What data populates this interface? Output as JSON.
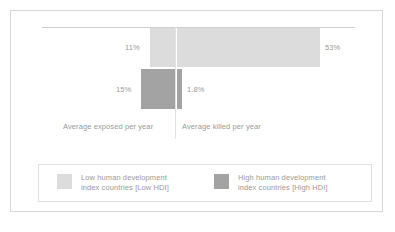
{
  "chart_data": {
    "type": "bar",
    "title": "",
    "subtitle": "",
    "orientation": "horizontal-diverging",
    "xlabel": "",
    "ylabel": "",
    "grid": false,
    "legend_position": "bottom",
    "categories": [
      "Average exposed per year",
      "Average killed per year"
    ],
    "series": [
      {
        "name": "Low human development index countries (Low HDI)",
        "color": "#dcdcdc",
        "values": [
          11,
          53
        ],
        "value_labels": [
          "11%",
          "53%"
        ]
      },
      {
        "name": "High human development index countries (High HDI)",
        "color": "#a3a3a3",
        "values": [
          15,
          1.8
        ],
        "value_labels": [
          "15%",
          "1.8%"
        ]
      }
    ],
    "units": "percent",
    "axis_labels": {
      "left": "Average exposed per year",
      "right": "Average killed per year"
    }
  },
  "plot": {
    "value_labels": {
      "exposed_low": "11%",
      "killed_low": "53%",
      "exposed_high": "15%",
      "killed_high": "1.8%"
    },
    "axis_labels": {
      "exposed": "Average exposed per year",
      "killed": "Average killed per year"
    }
  },
  "legend": {
    "entries": [
      {
        "swatch_color": "#dcdcdc",
        "line1": "Low human development",
        "line2": "index countries [Low HDI]"
      },
      {
        "swatch_color": "#a3a3a3",
        "line1": "High human development",
        "line2": "index countries [High HDI]"
      }
    ]
  },
  "colors": {
    "low_hdi": "#dcdcdc",
    "high_hdi": "#a3a3a3",
    "text": "#9a9a9a",
    "frame": "#d8d8d8",
    "axis": "#cfcfcf",
    "background": "#ffffff"
  }
}
